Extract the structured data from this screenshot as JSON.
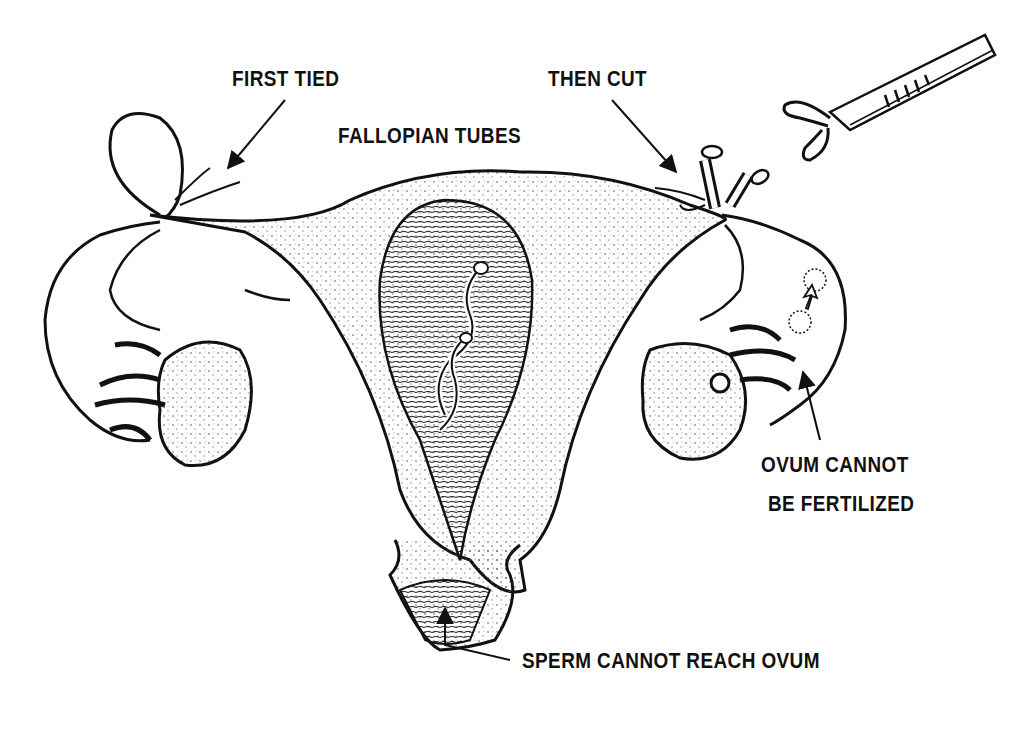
{
  "diagram": {
    "labels": {
      "first_tied": "FIRST  TIED",
      "then_cut": "THEN CUT",
      "fallopian_tubes": "FALLOPIAN TUBES",
      "ovum_line1": "OVUM CANNOT",
      "ovum_line2": "BE FERTILIZED",
      "sperm": "SPERM CANNOT  REACH OVUM"
    },
    "colors": {
      "ink": "#111111",
      "background": "#ffffff",
      "stipple": "#555555"
    }
  }
}
